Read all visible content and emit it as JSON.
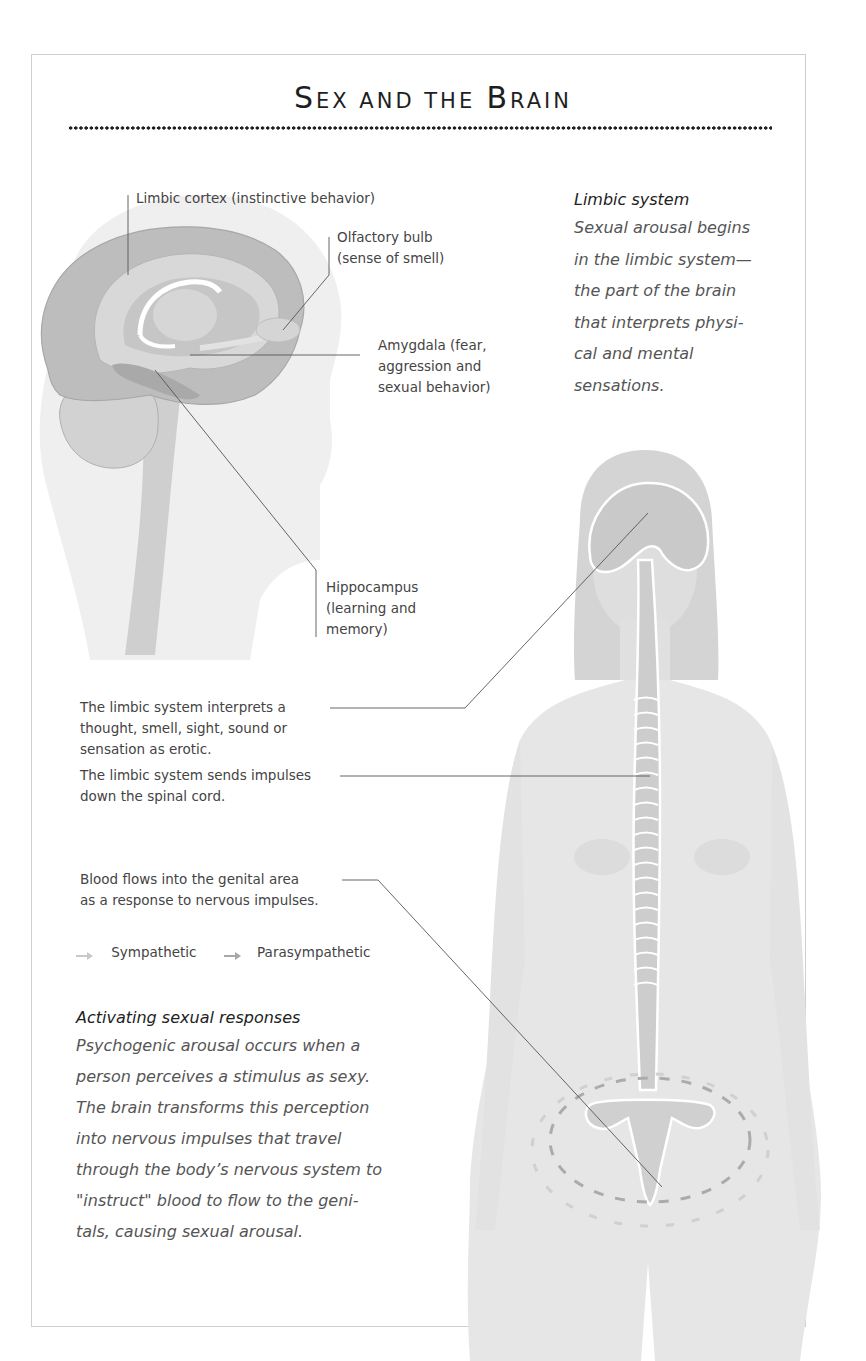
{
  "title": {
    "word1_initial": "S",
    "word1_rest": "EX AND THE",
    "word2_initial": "B",
    "word2_rest": "RAIN",
    "full": "Sex and the Brain"
  },
  "brain_labels": {
    "limbic_cortex": "Limbic cortex (instinctive behavior)",
    "olfactory_bulb_line1": "Olfactory bulb",
    "olfactory_bulb_line2": "(sense of smell)",
    "amygdala_line1": "Amygdala (fear,",
    "amygdala_line2": "aggression and",
    "amygdala_line3": "sexual behavior)",
    "hippocampus_line1": "Hippocampus",
    "hippocampus_line2": "(learning and",
    "hippocampus_line3": "memory)"
  },
  "limbic_sidebar": {
    "heading": "Limbic system",
    "body": "Sexual arousal begins\nin the limbic system—\nthe part of the brain\nthat interprets physi-\ncal and mental\nsensations."
  },
  "process_steps": [
    {
      "line1": "The limbic system interprets a",
      "line2": "thought, smell, sight, sound or",
      "line3": "sensation as erotic."
    },
    {
      "line1": "The limbic system sends impulses",
      "line2": "down the spinal cord."
    },
    {
      "line1": "Blood flows into the genital area",
      "line2": "as a response to nervous impulses."
    }
  ],
  "legend": {
    "items": [
      {
        "label": "Sympathetic",
        "color": "#c9c9c9"
      },
      {
        "label": "Parasympathetic",
        "color": "#a8a8a8"
      }
    ]
  },
  "activating_section": {
    "heading": "Activating sexual responses",
    "body": "Psychogenic arousal occurs when a\nperson perceives a stimulus as sexy.\nThe brain transforms this perception\ninto nervous impulses that travel\nthrough the body’s nervous system to\n\"instruct\" blood to flow to the geni-\ntals, causing sexual arousal."
  },
  "colors": {
    "frame_border": "#cfcfcf",
    "silhouette": "#e6e6e6",
    "brain_dark": "#b4b4b4",
    "brain_mid": "#c8c8c8",
    "brain_light": "#dcdcdc",
    "leader_line": "#555555"
  }
}
